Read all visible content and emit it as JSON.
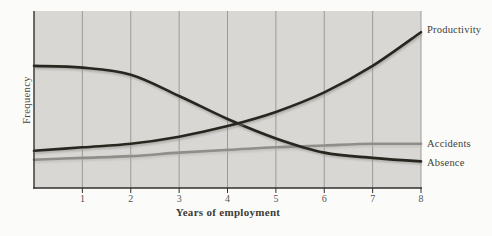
{
  "page": {
    "background": "#fbfbfa"
  },
  "chart_data": {
    "type": "line",
    "title": "",
    "xlabel": "Years of employment",
    "ylabel": "Frequency",
    "x": [
      0,
      1,
      2,
      3,
      4,
      5,
      6,
      7,
      8
    ],
    "x_ticks": [
      1,
      2,
      3,
      4,
      5,
      6,
      7,
      8
    ],
    "xlim": [
      0,
      8
    ],
    "ylim": [
      0,
      100
    ],
    "grid": "vertical-only",
    "legend_position": "labels-at-curve-ends-right",
    "plot_background": "#d8d7d4",
    "gridline_color": "#9c9b99",
    "axis_color": "#33312e",
    "series": [
      {
        "name": "Accidents",
        "color": "#8f8e8b",
        "shadow_color": "#b5b4b0",
        "values": [
          16,
          17,
          18,
          20,
          21.5,
          23,
          24,
          25,
          25
        ]
      },
      {
        "name": "Absence",
        "color": "#29261f",
        "shadow_color": "#8a8a86",
        "values": [
          69,
          68,
          64,
          52,
          39,
          28,
          20,
          17,
          15
        ]
      },
      {
        "name": "Productivity",
        "color": "#29261f",
        "shadow_color": "#8a8a86",
        "values": [
          21,
          23,
          25,
          29,
          35,
          43,
          54,
          69,
          88
        ]
      }
    ]
  }
}
